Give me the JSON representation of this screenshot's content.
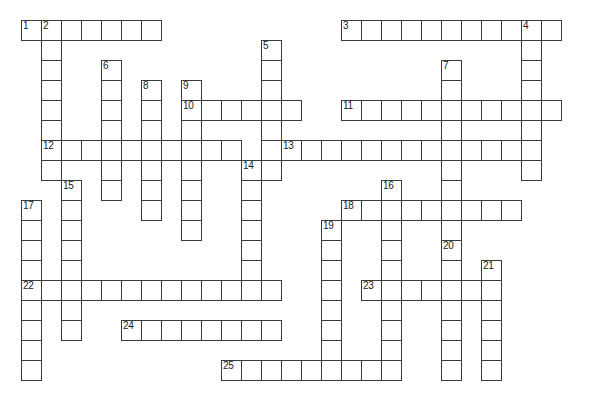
{
  "puzzle": {
    "title": "Crossword Puzzle Grid",
    "cell_size": 20,
    "origin_x": 21,
    "origin_y": 20,
    "grid_cols": 29,
    "grid_rows": 19,
    "background_color": "#ffffff",
    "line_color": "#3a3a3a",
    "number_color": "#1a1a1a",
    "entries": [
      {
        "number": "1",
        "direction": "across",
        "col": 0,
        "row": 0,
        "length": 7
      },
      {
        "number": "3",
        "direction": "across",
        "col": 16,
        "row": 0,
        "length": 11
      },
      {
        "number": "2",
        "direction": "down",
        "col": 1,
        "row": 0,
        "length": 8
      },
      {
        "number": "4",
        "direction": "down",
        "col": 25,
        "row": 0,
        "length": 8
      },
      {
        "number": "5",
        "direction": "down",
        "col": 12,
        "row": 1,
        "length": 7
      },
      {
        "number": "6",
        "direction": "down",
        "col": 4,
        "row": 2,
        "length": 7
      },
      {
        "number": "7",
        "direction": "down",
        "col": 21,
        "row": 2,
        "length": 10
      },
      {
        "number": "8",
        "direction": "down",
        "col": 6,
        "row": 3,
        "length": 7
      },
      {
        "number": "9",
        "direction": "down",
        "col": 8,
        "row": 3,
        "length": 8
      },
      {
        "number": "10",
        "direction": "across",
        "col": 8,
        "row": 4,
        "length": 6
      },
      {
        "number": "11",
        "direction": "across",
        "col": 16,
        "row": 4,
        "length": 11
      },
      {
        "number": "12",
        "direction": "across",
        "col": 1,
        "row": 6,
        "length": 10
      },
      {
        "number": "13",
        "direction": "across",
        "col": 13,
        "row": 6,
        "length": 12
      },
      {
        "number": "14",
        "direction": "down",
        "col": 11,
        "row": 7,
        "length": 6
      },
      {
        "number": "15",
        "direction": "down",
        "col": 2,
        "row": 8,
        "length": 8
      },
      {
        "number": "16",
        "direction": "down",
        "col": 18,
        "row": 8,
        "length": 10
      },
      {
        "number": "17",
        "direction": "down",
        "col": 0,
        "row": 9,
        "length": 9
      },
      {
        "number": "18",
        "direction": "across",
        "col": 16,
        "row": 9,
        "length": 9
      },
      {
        "number": "19",
        "direction": "down",
        "col": 15,
        "row": 10,
        "length": 8
      },
      {
        "number": "20",
        "direction": "down",
        "col": 21,
        "row": 11,
        "length": 7
      },
      {
        "number": "21",
        "direction": "down",
        "col": 23,
        "row": 12,
        "length": 6
      },
      {
        "number": "22",
        "direction": "across",
        "col": 0,
        "row": 13,
        "length": 13
      },
      {
        "number": "23",
        "direction": "across",
        "col": 17,
        "row": 13,
        "length": 7
      },
      {
        "number": "24",
        "direction": "across",
        "col": 5,
        "row": 15,
        "length": 8
      },
      {
        "number": "25",
        "direction": "across",
        "col": 10,
        "row": 17,
        "length": 9
      }
    ],
    "clue_numbers": [
      "1",
      "2",
      "3",
      "4",
      "5",
      "6",
      "7",
      "8",
      "9",
      "10",
      "11",
      "12",
      "13",
      "14",
      "15",
      "16",
      "17",
      "18",
      "19",
      "20",
      "21",
      "22",
      "23",
      "24",
      "25"
    ]
  }
}
